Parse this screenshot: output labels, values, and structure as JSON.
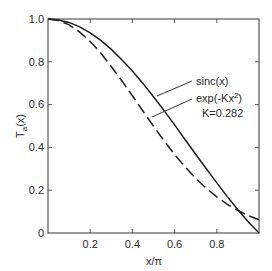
{
  "chart_data": {
    "type": "line",
    "title": "",
    "xlabel": "x/π",
    "ylabel": "T_a(x)",
    "ylabel_main": "T",
    "ylabel_sub": "a",
    "ylabel_arg": "(x)",
    "xlim": [
      0,
      1.0
    ],
    "ylim": [
      0,
      1.0
    ],
    "grid": false,
    "x_ticks": [
      {
        "value": 0.2,
        "label": "0.2"
      },
      {
        "value": 0.4,
        "label": "0.4"
      },
      {
        "value": 0.6,
        "label": "0.6"
      },
      {
        "value": 0.8,
        "label": "0.8"
      }
    ],
    "y_ticks": [
      {
        "value": 0,
        "label": "0"
      },
      {
        "value": 0.2,
        "label": "0.2"
      },
      {
        "value": 0.4,
        "label": "0.4"
      },
      {
        "value": 0.6,
        "label": "0.6"
      },
      {
        "value": 0.8,
        "label": "0.8"
      },
      {
        "value": 1.0,
        "label": "1.0"
      }
    ],
    "x": [
      0.0,
      0.05,
      0.1,
      0.15,
      0.2,
      0.25,
      0.3,
      0.35,
      0.4,
      0.45,
      0.5,
      0.55,
      0.6,
      0.65,
      0.7,
      0.75,
      0.8,
      0.85,
      0.9,
      0.95,
      1.0
    ],
    "series": [
      {
        "name": "sinc(x)",
        "style": "solid",
        "values": [
          1.0,
          0.996,
          0.984,
          0.963,
          0.935,
          0.9,
          0.858,
          0.81,
          0.757,
          0.699,
          0.637,
          0.572,
          0.505,
          0.436,
          0.368,
          0.3,
          0.234,
          0.17,
          0.109,
          0.052,
          0.0
        ]
      },
      {
        "name": "exp(-Kx²)",
        "style": "dashed",
        "param_label": "K=0.282",
        "values": [
          1.0,
          0.993,
          0.973,
          0.939,
          0.895,
          0.841,
          0.778,
          0.711,
          0.641,
          0.57,
          0.499,
          0.431,
          0.367,
          0.309,
          0.255,
          0.209,
          0.169,
          0.134,
          0.105,
          0.081,
          0.062
        ]
      }
    ],
    "annotations": [
      {
        "text": "sinc(x)",
        "target_series": "sinc(x)"
      },
      {
        "text": "exp(-Kx²)",
        "target_series": "exp(-Kx²)"
      },
      {
        "text": "K=0.282",
        "target_series": "exp(-Kx²)"
      }
    ],
    "legend": {
      "position": "inline-right"
    }
  },
  "labels": {
    "sinc": "sinc(x)",
    "exp_prefix": "exp(-Kx",
    "exp_sup": "2",
    "exp_suffix": ")",
    "k_value": "K=0.282",
    "x_axis": "x/π",
    "y_main": "T",
    "y_sub": "a",
    "y_arg": "(x)"
  },
  "colors": {
    "line": "#1e1e1e",
    "axis": "#555555",
    "background": "#ffffff"
  }
}
